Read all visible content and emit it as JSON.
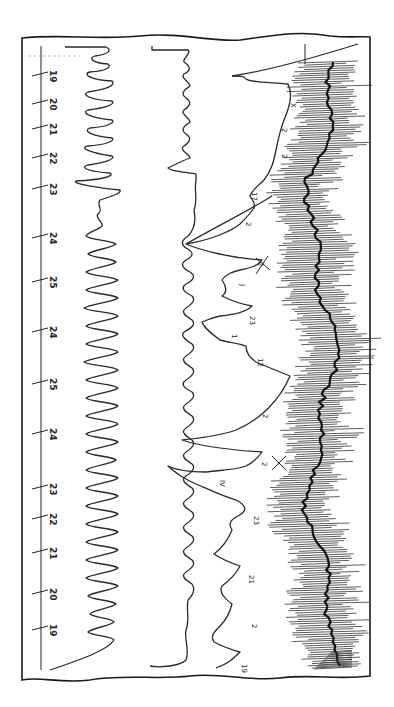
{
  "chart_data": {
    "type": "line",
    "title": "",
    "orientation": "rotated 90° (time runs top-to-bottom along left axis)",
    "xlabel": "",
    "ylabel": "",
    "axis": {
      "tick_labels": [
        "19",
        "20",
        "21",
        "22",
        "23",
        "24",
        "25",
        "24",
        "25",
        "24",
        "23",
        "22",
        "21",
        "20",
        "19"
      ],
      "tick_positions_px": [
        74,
        102,
        127,
        156,
        187,
        236,
        280,
        330,
        382,
        432,
        487,
        517,
        551,
        592,
        628
      ]
    },
    "series": [
      {
        "name": "trace-1",
        "description": "high-amplitude oscillation, irregular middle segment"
      },
      {
        "name": "trace-2",
        "description": "lower-amplitude regular oscillation with steps"
      },
      {
        "name": "trace-3",
        "description": "baseline with downward arcs / spikes, annotated"
      },
      {
        "name": "trace-4",
        "description": "dense hatched high-frequency band"
      }
    ],
    "annotations": [
      "X",
      "2",
      "2",
      "17",
      "2",
      "X",
      "2",
      "23",
      "1",
      "12",
      "2",
      "2",
      "X",
      "IV",
      "23",
      "21",
      "2",
      "19",
      "22"
    ],
    "grid": false,
    "legend": "none"
  }
}
